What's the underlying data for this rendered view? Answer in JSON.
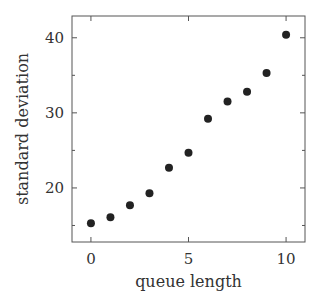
{
  "chart_data": {
    "type": "scatter",
    "title": "",
    "xlabel": "queue length",
    "ylabel": "standard deviation",
    "xlim": [
      -0.97,
      10.97
    ],
    "ylim": [
      12.8,
      42.9
    ],
    "xticks": [
      0,
      5,
      10
    ],
    "yticks": [
      20,
      30,
      40
    ],
    "x_minor_ticks": [],
    "y_minor_ticks": [
      15,
      25,
      35
    ],
    "grid": false,
    "legend": null,
    "series": [
      {
        "name": "",
        "marker": "filled-circle",
        "color": "#222222",
        "x": [
          0,
          1,
          2,
          3,
          4,
          5,
          6,
          7,
          8,
          9,
          10
        ],
        "y": [
          15.3,
          16.1,
          17.7,
          19.3,
          22.7,
          24.7,
          29.2,
          31.5,
          32.8,
          35.3,
          40.4
        ]
      }
    ]
  },
  "layout": {
    "plot_left": 72,
    "plot_top": 16,
    "plot_right": 305,
    "plot_bottom": 242,
    "axis_color": "#555555",
    "text_color": "#333333",
    "marker_radius": 4
  }
}
